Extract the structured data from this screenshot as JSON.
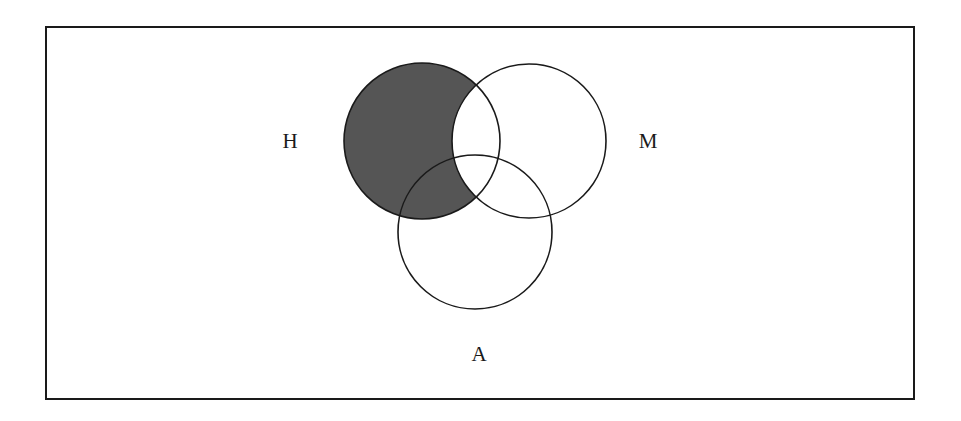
{
  "diagram": {
    "type": "venn",
    "frame": {
      "x": 46,
      "y": 27,
      "width": 868,
      "height": 372
    },
    "sets": [
      {
        "id": "H",
        "label": "H",
        "cx": 422,
        "cy": 141,
        "r": 78,
        "label_x": 290,
        "label_y": 148
      },
      {
        "id": "M",
        "label": "M",
        "cx": 529,
        "cy": 141,
        "r": 77,
        "label_x": 648,
        "label_y": 148
      },
      {
        "id": "A",
        "label": "A",
        "cx": 475,
        "cy": 232,
        "r": 77,
        "label_x": 479,
        "label_y": 361
      }
    ],
    "shaded_region": "H minus M",
    "shade_color": "#555555",
    "stroke_color": "#1a1a1a"
  }
}
